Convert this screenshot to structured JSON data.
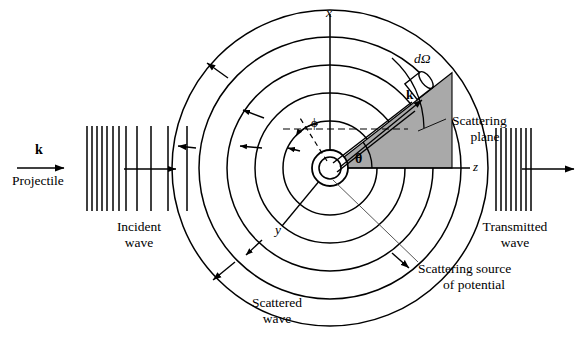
{
  "figure": {
    "colors": {
      "line": "#000000",
      "wedge_fill": "#a9a9a9",
      "wedge_stroke": "#000000",
      "background": "#ffffff",
      "thin_line": "#555555"
    },
    "axes": {
      "x_label": "x",
      "y_label": "y",
      "z_label": "z"
    },
    "angles": {
      "theta_label": "θ",
      "phi_label": "ϕ"
    },
    "labels": {
      "incident_k": "k",
      "projectile": "Projectile",
      "incident_wave_line1": "Incident",
      "incident_wave_line2": "wave",
      "scattered_wave_line1": "Scattered",
      "scattered_wave_line2": "wave",
      "transmitted_wave_line1": "Transmitted",
      "transmitted_wave_line2": "wave",
      "scattering_plane_line1": "Scattering",
      "scattering_plane_line2": "plane",
      "scattering_source_line1": "Scattering source",
      "scattering_source_line2": "of potential",
      "solid_angle": "dΩ",
      "scattered_k": "k"
    },
    "geometry": {
      "center_x": 330,
      "center_y": 168,
      "circle_radii": [
        18,
        11,
        47,
        75,
        103,
        131,
        158
      ],
      "scatter_ray_angle_deg": 38,
      "phi_angle_deg": 62,
      "theta_degrees_approx": 38
    }
  }
}
